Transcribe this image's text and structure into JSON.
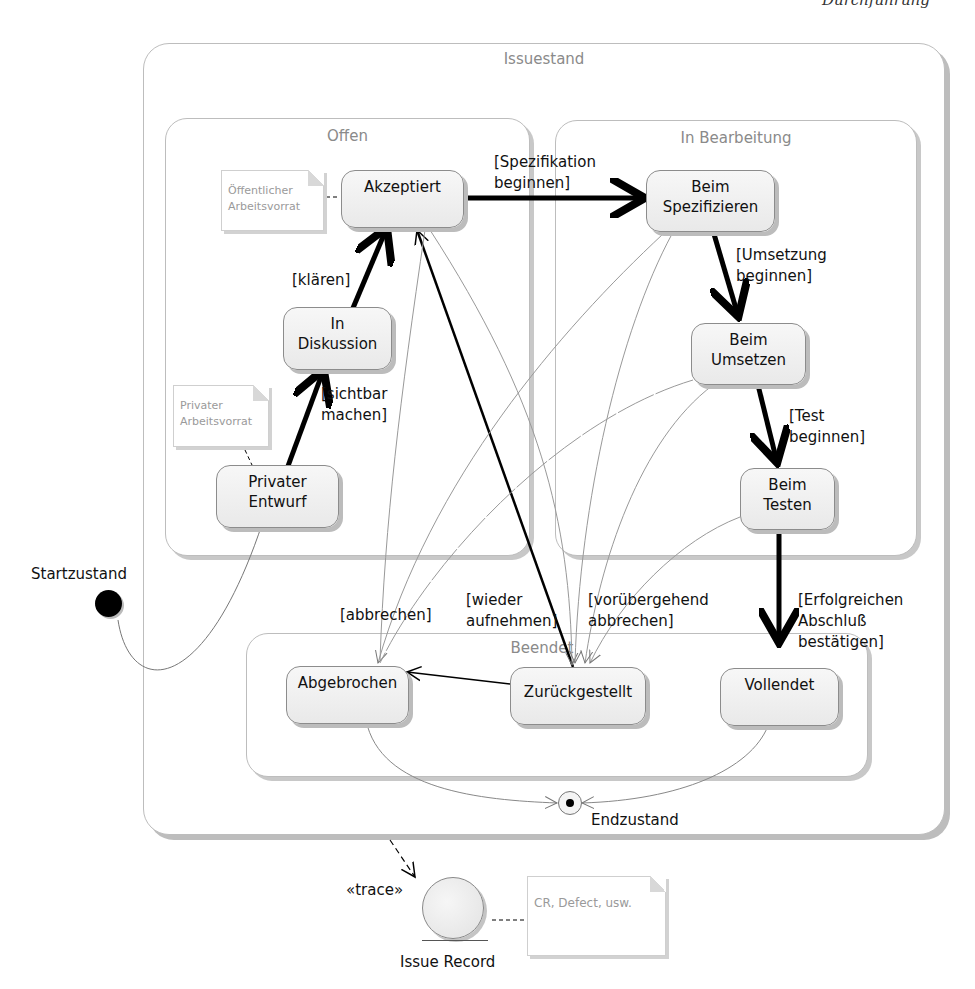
{
  "header": {
    "clipped_title": "Durchführung"
  },
  "regions": {
    "outer": {
      "title": "Issuestand"
    },
    "open": {
      "title": "Offen"
    },
    "in_progress": {
      "title": "In Bearbeitung"
    },
    "finished": {
      "title": "Beendet"
    }
  },
  "states": {
    "akzeptiert": "Akzeptiert",
    "in_diskussion": "In\nDiskussion",
    "privater_entwurf": "Privater\nEntwurf",
    "beim_spezifizieren": "Beim\nSpezifizieren",
    "beim_umsetzen": "Beim\nUmsetzen",
    "beim_testen": "Beim\nTesten",
    "abgebrochen": "Abgebrochen",
    "zurueckgestellt": "Zurückgestellt",
    "vollendet": "Vollendet"
  },
  "pseudostates": {
    "start": "Startzustand",
    "end": "Endzustand"
  },
  "transitions": {
    "klaeren": "[klären]",
    "sichtbar_machen": "[sichtbar\nmachen]",
    "spezifikation_beginnen": "[Spezifikation\nbeginnen]",
    "umsetzung_beginnen": "[Umsetzung\nbeginnen]",
    "test_beginnen": "[Test\nbeginnen]",
    "erfolgreichen_abschluss": "[Erfolgreichen\nAbschluß\nbestätigen]",
    "abbrechen": "[abbrechen]",
    "wieder_aufnehmen": "[wieder\naufnehmen]",
    "voruebergehend_abbrechen": "[vorübergehend\nabbrechen]"
  },
  "notes": {
    "oeffentlicher": "Öffentlicher\nArbeitsvorrat",
    "privater": "Privater\nArbeitsvorrat",
    "issue_record": "CR, Defect, usw."
  },
  "artifact": {
    "stereotype": "«trace»",
    "name": "Issue Record"
  }
}
